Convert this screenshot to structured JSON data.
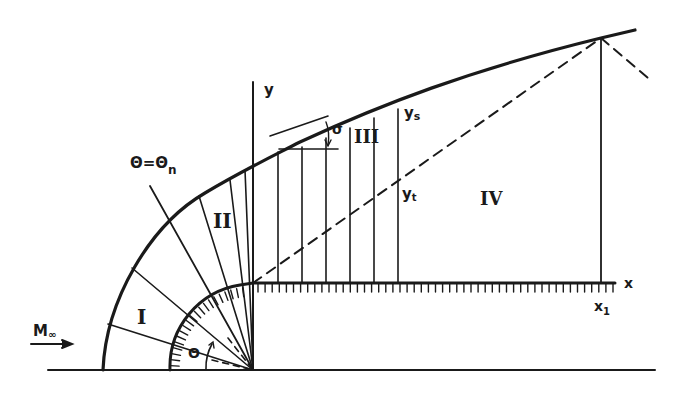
{
  "figure": {
    "colors": {
      "ink": "#1a1a1a",
      "background": "#ffffff"
    },
    "labels": {
      "freestream": "M",
      "freestream_sub": "∞",
      "y_axis": "y",
      "x_axis": "x",
      "x1": "x",
      "x1_sub": "1",
      "ys": "y",
      "ys_sub": "s",
      "yt": "y",
      "yt_sub": "t",
      "sigma": "σ",
      "theta": "Θ",
      "theta_n": "Θ=Θ",
      "theta_n_sub": "n"
    },
    "regions": [
      "I",
      "II",
      "III",
      "IV"
    ]
  }
}
